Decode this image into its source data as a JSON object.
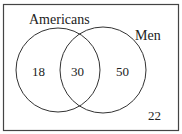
{
  "diagram": {
    "type": "venn",
    "sets": [
      {
        "name": "Americans",
        "only_count": "18"
      },
      {
        "name": "Men",
        "only_count": "50"
      }
    ],
    "intersection_count": "30",
    "outside_count": "22",
    "stroke_color": "#333333"
  }
}
